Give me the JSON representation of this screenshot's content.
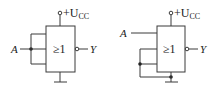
{
  "diagram": {
    "title": "",
    "circuits": [
      {
        "id": "left",
        "gate_symbol": "≥1",
        "gate_type": "OR (NOR with inverted output)",
        "input_label": "A",
        "output_label": "Y",
        "supply_label_prefix": "+U",
        "supply_label_sub": "CC",
        "input_connection": "all inputs tied together to A"
      },
      {
        "id": "right",
        "gate_symbol": "≥1",
        "gate_type": "OR (NOR with inverted output)",
        "input_label": "A",
        "output_label": "Y",
        "supply_label_prefix": "+U",
        "supply_label_sub": "CC",
        "input_connection": "unused inputs tied to ground"
      }
    ]
  }
}
